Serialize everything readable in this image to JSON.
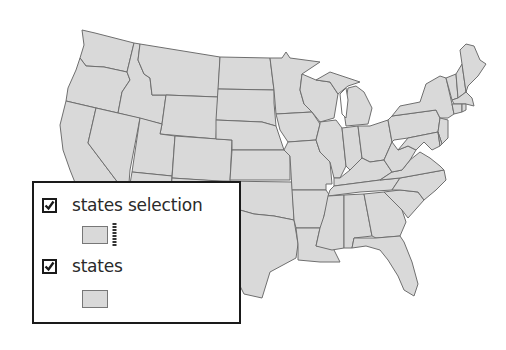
{
  "map": {
    "fill_color": "#d9d9d9",
    "border_color": "#6f6f6f",
    "background": "#ffffff"
  },
  "legend": {
    "border_color": "#1a1a1a",
    "layers": [
      {
        "label": "states selection",
        "checked": true,
        "symbol": "polygon-with-selection-outline"
      },
      {
        "label": "states",
        "checked": true,
        "symbol": "polygon"
      }
    ]
  }
}
